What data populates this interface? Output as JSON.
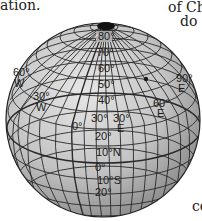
{
  "text_fragments": {
    "top_left": "ation.",
    "top_right_1": "of Chi",
    "top_right_2": "do",
    "bottom_right": "co"
  },
  "globe": {
    "latitude_labels": [
      "80°",
      "70°",
      "60°",
      "50°",
      "40°",
      "30°",
      "20°",
      "10°N",
      "0°",
      "10°S",
      "20°"
    ],
    "longitude_labels": [
      {
        "deg": "60°",
        "dir": "W"
      },
      {
        "deg": "30°",
        "dir": "W"
      },
      {
        "deg": "0°",
        "dir": ""
      },
      {
        "deg": "30°",
        "dir": "E"
      },
      {
        "deg": "60°",
        "dir": "E"
      },
      {
        "deg": "90°",
        "dir": "E"
      }
    ],
    "marker": "location-dot"
  },
  "colors": {
    "globe_fill": "#c8c8c8",
    "grid_line": "#2a2a2a",
    "pole": "#111111"
  }
}
